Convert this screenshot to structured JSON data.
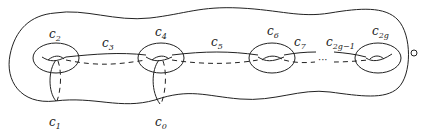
{
  "diagram": {
    "labels": {
      "c2": {
        "base": "c",
        "sub": "2"
      },
      "c3": {
        "base": "c",
        "sub": "3"
      },
      "c4": {
        "base": "c",
        "sub": "4"
      },
      "c5": {
        "base": "c",
        "sub": "5"
      },
      "c6": {
        "base": "c",
        "sub": "6"
      },
      "c7": {
        "base": "c",
        "sub": "7"
      },
      "c2g1": {
        "base": "c",
        "sub": "2g−1"
      },
      "c2g": {
        "base": "c",
        "sub": "2g"
      },
      "c1": {
        "base": "c",
        "sub": "1"
      },
      "c0": {
        "base": "c",
        "sub": "0"
      }
    },
    "ellipsis": "···",
    "puncture_symbol": "○",
    "colors": {
      "stroke": "#222222",
      "background": "#ffffff"
    }
  }
}
